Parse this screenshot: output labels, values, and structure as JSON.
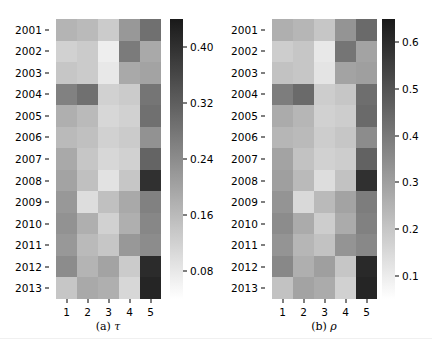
{
  "figure": {
    "width": 432,
    "height": 355,
    "background": "#ffffff",
    "colormap": "grayscale-reversed",
    "colormap_low": "#ffffff",
    "colormap_high": "#1a1a1a"
  },
  "panels": [
    {
      "id": "panel-a",
      "caption_prefix": "(a)",
      "caption_symbol": "τ",
      "chart_data": {
        "type": "heatmap",
        "title": "(a) τ",
        "xlabel": "",
        "ylabel": "",
        "grid": false,
        "legend_position": "right",
        "x": [
          "1",
          "2",
          "3",
          "4",
          "5"
        ],
        "y": [
          "2001",
          "2002",
          "2003",
          "2004",
          "2005",
          "2006",
          "2007",
          "2008",
          "2009",
          "2010",
          "2011",
          "2012",
          "2013"
        ],
        "zlim": [
          0.04,
          0.44
        ],
        "colorbar_ticks": [
          0.08,
          0.16,
          0.24,
          0.32,
          0.4
        ],
        "colorbar_tick_labels": [
          "0.08",
          "0.16",
          "0.24",
          "0.32",
          "0.40"
        ],
        "values": [
          [
            0.17,
            0.16,
            0.13,
            0.22,
            0.29
          ],
          [
            0.12,
            0.13,
            0.07,
            0.27,
            0.19
          ],
          [
            0.14,
            0.13,
            0.08,
            0.19,
            0.2
          ],
          [
            0.26,
            0.29,
            0.12,
            0.13,
            0.28
          ],
          [
            0.18,
            0.16,
            0.11,
            0.12,
            0.29
          ],
          [
            0.16,
            0.15,
            0.12,
            0.13,
            0.23
          ],
          [
            0.19,
            0.14,
            0.11,
            0.12,
            0.31
          ],
          [
            0.2,
            0.15,
            0.09,
            0.14,
            0.4
          ],
          [
            0.22,
            0.1,
            0.15,
            0.19,
            0.26
          ],
          [
            0.23,
            0.18,
            0.12,
            0.18,
            0.25
          ],
          [
            0.22,
            0.16,
            0.14,
            0.22,
            0.24
          ],
          [
            0.24,
            0.17,
            0.2,
            0.13,
            0.41
          ],
          [
            0.14,
            0.19,
            0.18,
            0.11,
            0.42
          ]
        ]
      }
    },
    {
      "id": "panel-b",
      "caption_prefix": "(b)",
      "caption_symbol": "ρ",
      "chart_data": {
        "type": "heatmap",
        "title": "(b) ρ",
        "xlabel": "",
        "ylabel": "",
        "grid": false,
        "legend_position": "right",
        "x": [
          "1",
          "2",
          "3",
          "4",
          "5"
        ],
        "y": [
          "2001",
          "2002",
          "2003",
          "2004",
          "2005",
          "2006",
          "2007",
          "2008",
          "2009",
          "2010",
          "2011",
          "2012",
          "2013"
        ],
        "zlim": [
          0.05,
          0.65
        ],
        "colorbar_ticks": [
          0.1,
          0.2,
          0.3,
          0.4,
          0.5,
          0.6
        ],
        "colorbar_tick_labels": [
          "0.1",
          "0.2",
          "0.3",
          "0.4",
          "0.5",
          "0.6"
        ],
        "values": [
          [
            0.26,
            0.24,
            0.2,
            0.33,
            0.44
          ],
          [
            0.18,
            0.2,
            0.11,
            0.41,
            0.29
          ],
          [
            0.21,
            0.2,
            0.12,
            0.29,
            0.3
          ],
          [
            0.39,
            0.44,
            0.18,
            0.2,
            0.43
          ],
          [
            0.27,
            0.24,
            0.17,
            0.18,
            0.44
          ],
          [
            0.24,
            0.23,
            0.18,
            0.2,
            0.35
          ],
          [
            0.29,
            0.21,
            0.17,
            0.18,
            0.46
          ],
          [
            0.3,
            0.23,
            0.14,
            0.21,
            0.59
          ],
          [
            0.33,
            0.15,
            0.23,
            0.29,
            0.39
          ],
          [
            0.35,
            0.27,
            0.18,
            0.27,
            0.38
          ],
          [
            0.33,
            0.24,
            0.21,
            0.33,
            0.36
          ],
          [
            0.36,
            0.26,
            0.3,
            0.2,
            0.61
          ],
          [
            0.21,
            0.29,
            0.27,
            0.17,
            0.62
          ]
        ]
      }
    }
  ]
}
